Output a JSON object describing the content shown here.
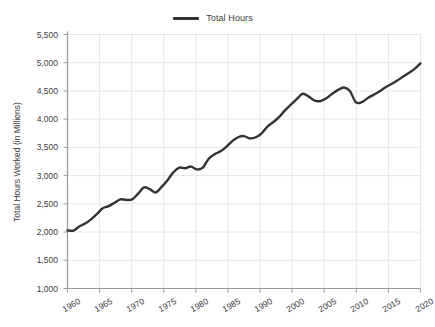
{
  "legend": {
    "position": "top-center",
    "entries": [
      {
        "label": "Total Hours",
        "color": "#333333"
      }
    ]
  },
  "axes": {
    "ylabel": "Total Hours Worked (in Millions)",
    "xlabel": "",
    "y_ticks": [
      "1,000",
      "1,500",
      "2,000",
      "2,500",
      "3,000",
      "3,500",
      "4,000",
      "4,500",
      "5,000",
      "5,500"
    ],
    "x_ticks": [
      "1960",
      "1965",
      "1970",
      "1975",
      "1980",
      "1985",
      "1990",
      "2000",
      "2005",
      "2010",
      "2015",
      "2020"
    ]
  },
  "style": {
    "background": "#ffffff",
    "grid_color": "#e6e6e6",
    "axis_color": "#9a9a9a",
    "text_color": "#3b3b3b",
    "line_color": "#333333",
    "line_width": 2.4
  },
  "chart_data": {
    "type": "line",
    "title": "",
    "xlabel": "",
    "ylabel": "Total Hours Worked (in Millions)",
    "xlim": [
      1960,
      2020
    ],
    "ylim": [
      1000,
      5500
    ],
    "grid": true,
    "legend_position": "top-center",
    "xtick_labels": [
      "1960",
      "1965",
      "1970",
      "1975",
      "1980",
      "1985",
      "1990",
      "2000",
      "2005",
      "2010",
      "2015",
      "2020"
    ],
    "ytick_values": [
      1000,
      1500,
      2000,
      2500,
      3000,
      3500,
      4000,
      4500,
      5000,
      5500
    ],
    "series": [
      {
        "name": "Total Hours",
        "color": "#333333",
        "x": [
          1960,
          1961,
          1962,
          1963,
          1964,
          1965,
          1966,
          1967,
          1968,
          1969,
          1970,
          1971,
          1972,
          1973,
          1974,
          1975,
          1976,
          1977,
          1978,
          1979,
          1980,
          1981,
          1982,
          1983,
          1984,
          1985,
          1986,
          1987,
          1988,
          1989,
          1990,
          1991,
          1992,
          1993,
          1994,
          1995,
          1996,
          1997,
          1998,
          1999,
          2000,
          2001,
          2002,
          2003,
          2004,
          2005,
          2006,
          2007,
          2008,
          2009,
          2010,
          2011,
          2012,
          2013,
          2014,
          2015,
          2016,
          2017,
          2018,
          2019,
          2020
        ],
        "y": [
          2030,
          2025,
          2100,
          2150,
          2225,
          2320,
          2420,
          2460,
          2520,
          2580,
          2570,
          2580,
          2680,
          2790,
          2760,
          2700,
          2800,
          2920,
          3060,
          3140,
          3130,
          3160,
          3110,
          3140,
          3300,
          3380,
          3430,
          3510,
          3610,
          3680,
          3700,
          3660,
          3680,
          3750,
          3870,
          3950,
          4040,
          4160,
          4260,
          4360,
          4450,
          4400,
          4330,
          4320,
          4370,
          4450,
          4520,
          4560,
          4500,
          4300,
          4300,
          4370,
          4430,
          4490,
          4560,
          4620,
          4680,
          4750,
          4820,
          4890,
          4990
        ]
      }
    ]
  }
}
